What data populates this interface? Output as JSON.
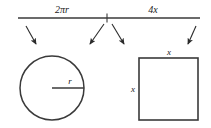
{
  "figure": {
    "background_color": "#ffffff",
    "stroke_color": "#3a3a3a",
    "text_color": "#1a1a1a",
    "segment_bar": {
      "left_segment_label": "2πr",
      "right_segment_label": "4x",
      "tick_label": "",
      "line_y": 18,
      "line_x_start": 18,
      "line_x_end": 200,
      "tick_x": 107
    },
    "arrows": [
      {
        "name": "arrow-to-circle-left",
        "from_x": 26,
        "from_y": 26,
        "to_x": 36,
        "to_y": 44
      },
      {
        "name": "arrow-to-circle-right",
        "from_x": 104,
        "from_y": 24,
        "to_x": 90,
        "to_y": 44
      },
      {
        "name": "arrow-to-square-left",
        "from_x": 112,
        "from_y": 24,
        "to_x": 124,
        "to_y": 44
      },
      {
        "name": "arrow-to-square-right",
        "from_x": 196,
        "from_y": 26,
        "to_x": 188,
        "to_y": 44
      }
    ],
    "circle": {
      "center_x": 52,
      "center_y": 88,
      "radius": 32,
      "radius_label": "r",
      "radius_label_x": 70,
      "radius_label_y": 84
    },
    "square": {
      "x": 139,
      "y": 58,
      "width": 59,
      "height": 62,
      "top_label": "x",
      "left_label": "x",
      "top_label_x": 169,
      "top_label_y": 55,
      "left_label_x": 133,
      "left_label_y": 92
    }
  }
}
